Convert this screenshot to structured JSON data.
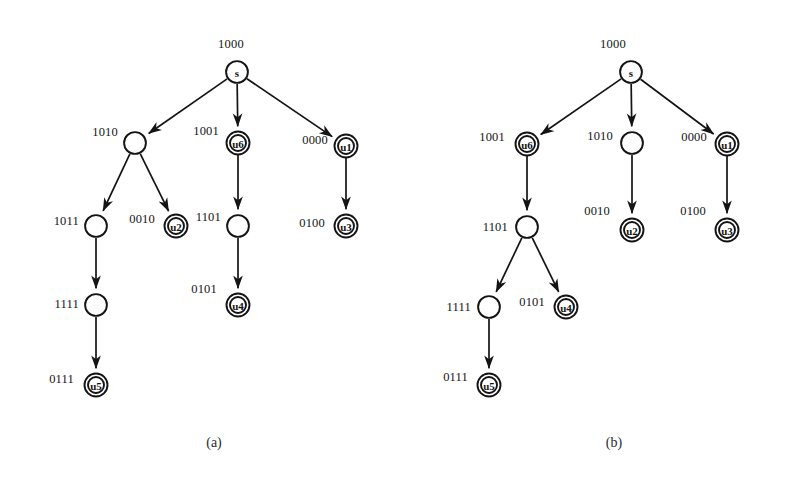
{
  "figure": {
    "background": "#ffffff",
    "ink_color": "#141414",
    "captions": [
      {
        "id": "cap-a",
        "text": "(a)",
        "x": 214,
        "y": 443
      },
      {
        "id": "cap-b",
        "text": "(b)",
        "x": 614,
        "y": 443
      }
    ]
  },
  "diagram_a": {
    "caption": "(a)",
    "nodes": [
      {
        "id": "a-s",
        "label": "s",
        "bits": "1000",
        "x": 237,
        "y": 72,
        "double": false,
        "bit_x": 231,
        "bit_y": 44,
        "bit_anchor": "center"
      },
      {
        "id": "a-n1",
        "label": "",
        "bits": "1010",
        "x": 135,
        "y": 143,
        "double": false,
        "bit_x": 118,
        "bit_y": 132,
        "bit_anchor": "right"
      },
      {
        "id": "a-u6",
        "label": "u6",
        "bits": "1001",
        "x": 238,
        "y": 143,
        "double": true,
        "bit_x": 219,
        "bit_y": 131,
        "bit_anchor": "right"
      },
      {
        "id": "a-u1",
        "label": "u1",
        "bits": "0000",
        "x": 346,
        "y": 146,
        "double": true,
        "bit_x": 328,
        "bit_y": 140,
        "bit_anchor": "right"
      },
      {
        "id": "a-n2",
        "label": "",
        "bits": "1011",
        "x": 96,
        "y": 226,
        "double": false,
        "bit_x": 79,
        "bit_y": 221,
        "bit_anchor": "right"
      },
      {
        "id": "a-u2",
        "label": "u2",
        "bits": "0010",
        "x": 176,
        "y": 226,
        "double": true,
        "bit_x": 155,
        "bit_y": 219,
        "bit_anchor": "right"
      },
      {
        "id": "a-n3",
        "label": "",
        "bits": "1101",
        "x": 238,
        "y": 226,
        "double": false,
        "bit_x": 221,
        "bit_y": 217,
        "bit_anchor": "right"
      },
      {
        "id": "a-u3",
        "label": "u3",
        "bits": "0100",
        "x": 346,
        "y": 226,
        "double": true,
        "bit_x": 325,
        "bit_y": 223,
        "bit_anchor": "right"
      },
      {
        "id": "a-n4",
        "label": "",
        "bits": "1111",
        "x": 96,
        "y": 305,
        "double": false,
        "bit_x": 79,
        "bit_y": 304,
        "bit_anchor": "right"
      },
      {
        "id": "a-u4",
        "label": "u4",
        "bits": "0101",
        "x": 238,
        "y": 305,
        "double": true,
        "bit_x": 217,
        "bit_y": 289,
        "bit_anchor": "right"
      },
      {
        "id": "a-u5",
        "label": "u5",
        "bits": "0111",
        "x": 96,
        "y": 385,
        "double": true,
        "bit_x": 74,
        "bit_y": 379,
        "bit_anchor": "right"
      }
    ],
    "edges": [
      {
        "from": "a-s",
        "to": "a-n1"
      },
      {
        "from": "a-s",
        "to": "a-u6"
      },
      {
        "from": "a-s",
        "to": "a-u1"
      },
      {
        "from": "a-n1",
        "to": "a-n2"
      },
      {
        "from": "a-n1",
        "to": "a-u2"
      },
      {
        "from": "a-u6",
        "to": "a-n3"
      },
      {
        "from": "a-u1",
        "to": "a-u3"
      },
      {
        "from": "a-n2",
        "to": "a-n4"
      },
      {
        "from": "a-n3",
        "to": "a-u4"
      },
      {
        "from": "a-n4",
        "to": "a-u5"
      }
    ]
  },
  "diagram_b": {
    "caption": "(b)",
    "nodes": [
      {
        "id": "b-s",
        "label": "s",
        "bits": "1000",
        "x": 631,
        "y": 72,
        "double": false,
        "bit_x": 613,
        "bit_y": 44,
        "bit_anchor": "center"
      },
      {
        "id": "b-u6",
        "label": "u6",
        "bits": "1001",
        "x": 527,
        "y": 144,
        "double": true,
        "bit_x": 505,
        "bit_y": 137,
        "bit_anchor": "right"
      },
      {
        "id": "b-n1",
        "label": "",
        "bits": "1010",
        "x": 632,
        "y": 143,
        "double": false,
        "bit_x": 613,
        "bit_y": 136,
        "bit_anchor": "right"
      },
      {
        "id": "b-u1",
        "label": "u1",
        "bits": "0000",
        "x": 727,
        "y": 144,
        "double": true,
        "bit_x": 707,
        "bit_y": 137,
        "bit_anchor": "right"
      },
      {
        "id": "b-n2",
        "label": "",
        "bits": "1101",
        "x": 527,
        "y": 227,
        "double": false,
        "bit_x": 508,
        "bit_y": 227,
        "bit_anchor": "right"
      },
      {
        "id": "b-u2",
        "label": "u2",
        "bits": "0010",
        "x": 632,
        "y": 230,
        "double": true,
        "bit_x": 610,
        "bit_y": 211,
        "bit_anchor": "right"
      },
      {
        "id": "b-u3",
        "label": "u3",
        "bits": "0100",
        "x": 727,
        "y": 230,
        "double": true,
        "bit_x": 706,
        "bit_y": 211,
        "bit_anchor": "right"
      },
      {
        "id": "b-n3",
        "label": "",
        "bits": "1111",
        "x": 489,
        "y": 307,
        "double": false,
        "bit_x": 471,
        "bit_y": 307,
        "bit_anchor": "right"
      },
      {
        "id": "b-u4",
        "label": "u4",
        "bits": "0101",
        "x": 566,
        "y": 307,
        "double": true,
        "bit_x": 545,
        "bit_y": 302,
        "bit_anchor": "right"
      },
      {
        "id": "b-u5",
        "label": "u5",
        "bits": "0111",
        "x": 489,
        "y": 385,
        "double": true,
        "bit_x": 468,
        "bit_y": 377,
        "bit_anchor": "right"
      }
    ],
    "edges": [
      {
        "from": "b-s",
        "to": "b-u6"
      },
      {
        "from": "b-s",
        "to": "b-n1"
      },
      {
        "from": "b-s",
        "to": "b-u1"
      },
      {
        "from": "b-u6",
        "to": "b-n2"
      },
      {
        "from": "b-n1",
        "to": "b-u2"
      },
      {
        "from": "b-u1",
        "to": "b-u3"
      },
      {
        "from": "b-n2",
        "to": "b-n3"
      },
      {
        "from": "b-n2",
        "to": "b-u4"
      },
      {
        "from": "b-n3",
        "to": "b-u5"
      }
    ]
  }
}
